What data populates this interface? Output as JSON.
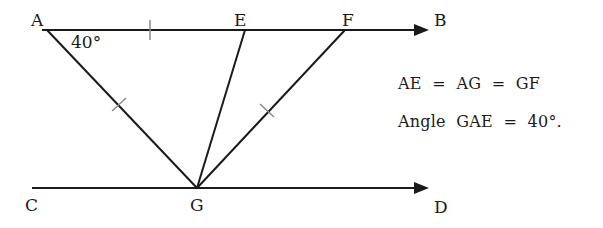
{
  "diagram": {
    "points": {
      "A": "A",
      "B": "B",
      "C": "C",
      "D": "D",
      "E": "E",
      "F": "F",
      "G": "G"
    },
    "angle_label": "40°",
    "given": {
      "line1": "AE  =  AG  =  GF",
      "line2": "Angle  GAE  =  40°."
    },
    "colors": {
      "line": "#1a1a1a",
      "tick": "#8a8a8a",
      "background": "#ffffff"
    }
  }
}
